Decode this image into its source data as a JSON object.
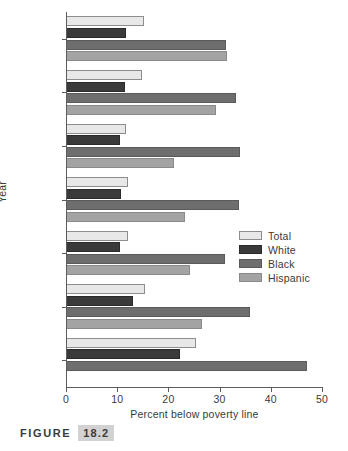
{
  "figure": {
    "caption_word": "FIGURE",
    "caption_number": "18.2"
  },
  "legend": {
    "position": "middle-right",
    "items": [
      {
        "label": "Total",
        "color": "#e8e8e8"
      },
      {
        "label": "White",
        "color": "#3a3a3a"
      },
      {
        "label": "Black",
        "color": "#6e6e6e"
      },
      {
        "label": "Hispanic",
        "color": "#a3a3a3"
      }
    ]
  },
  "axes": {
    "x_title": "Percent below poverty line",
    "y_title": "Year",
    "x_ticks": [
      "0",
      "10",
      "20",
      "30",
      "40",
      "50"
    ]
  },
  "chart_data": {
    "type": "bar",
    "orientation": "horizontal",
    "title": "",
    "xlabel": "Percent below poverty line",
    "ylabel": "Year",
    "xlim": [
      0,
      50
    ],
    "xticks": [
      0,
      10,
      20,
      30,
      40,
      50
    ],
    "grid": false,
    "legend_position": "middle-right",
    "categories": [
      "1994",
      "1992",
      "1991",
      "1990",
      "1985",
      "1979",
      "1970"
    ],
    "series": [
      {
        "name": "Total",
        "color": "#e8e8e8",
        "values": [
          15.2,
          14.8,
          11.7,
          12.1,
          12.1,
          15.4,
          25.4
        ]
      },
      {
        "name": "White",
        "color": "#3a3a3a",
        "values": [
          11.7,
          11.5,
          10.5,
          10.7,
          10.5,
          13.1,
          22.3
        ]
      },
      {
        "name": "Black",
        "color": "#6e6e6e",
        "values": [
          31.3,
          33.3,
          34.0,
          33.8,
          31.1,
          35.9,
          47.1
        ]
      },
      {
        "name": "Hispanic",
        "color": "#a3a3a3",
        "values": [
          31.5,
          29.3,
          21.0,
          23.2,
          24.2,
          26.5,
          null
        ]
      }
    ]
  }
}
